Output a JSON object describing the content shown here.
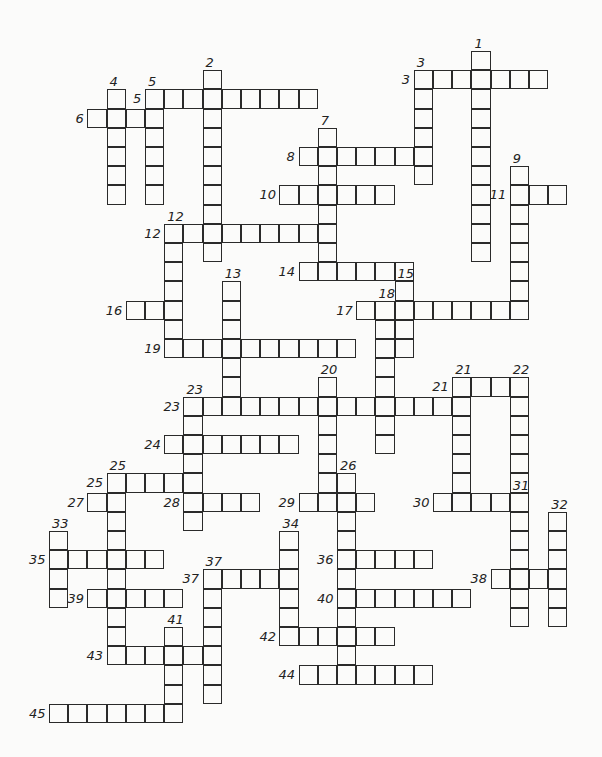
{
  "puzzle": {
    "type": "crossword",
    "grid_origin": {
      "x": 49,
      "y": 51,
      "cell": 19.2
    },
    "across": [
      {
        "number": "3",
        "col": 19,
        "row": 1,
        "length": 7
      },
      {
        "number": "5",
        "col": 5,
        "row": 2,
        "length": 9
      },
      {
        "number": "6",
        "col": 2,
        "row": 3,
        "length": 4
      },
      {
        "number": "8",
        "col": 13,
        "row": 5,
        "length": 7
      },
      {
        "number": "10",
        "col": 12,
        "row": 7,
        "length": 6
      },
      {
        "number": "11",
        "col": 24,
        "row": 7,
        "length": 3
      },
      {
        "number": "12",
        "col": 6,
        "row": 9,
        "length": 9
      },
      {
        "number": "14",
        "col": 13,
        "row": 11,
        "length": 6
      },
      {
        "number": "16",
        "col": 4,
        "row": 13,
        "length": 3
      },
      {
        "number": "17",
        "col": 16,
        "row": 13,
        "length": 9
      },
      {
        "number": "19",
        "col": 6,
        "row": 15,
        "length": 10
      },
      {
        "number": "21",
        "col": 21,
        "row": 17,
        "length": 4
      },
      {
        "number": "23",
        "col": 7,
        "row": 18,
        "length": 15
      },
      {
        "number": "24",
        "col": 6,
        "row": 20,
        "length": 7
      },
      {
        "number": "25",
        "col": 3,
        "row": 22,
        "length": 5
      },
      {
        "number": "27",
        "col": 2,
        "row": 23,
        "length": 2
      },
      {
        "number": "28",
        "col": 7,
        "row": 23,
        "length": 4
      },
      {
        "number": "29",
        "col": 13,
        "row": 23,
        "length": 4
      },
      {
        "number": "30",
        "col": 20,
        "row": 23,
        "length": 5
      },
      {
        "number": "35",
        "col": 0,
        "row": 26,
        "length": 6
      },
      {
        "number": "36",
        "col": 15,
        "row": 26,
        "length": 5
      },
      {
        "number": "37",
        "col": 8,
        "row": 27,
        "length": 5
      },
      {
        "number": "38",
        "col": 23,
        "row": 27,
        "length": 4
      },
      {
        "number": "39",
        "col": 2,
        "row": 28,
        "length": 5
      },
      {
        "number": "40",
        "col": 15,
        "row": 28,
        "length": 7
      },
      {
        "number": "42",
        "col": 12,
        "row": 30,
        "length": 6
      },
      {
        "number": "43",
        "col": 3,
        "row": 31,
        "length": 6
      },
      {
        "number": "44",
        "col": 13,
        "row": 32,
        "length": 7
      },
      {
        "number": "45",
        "col": 0,
        "row": 34,
        "length": 7
      }
    ],
    "down": [
      {
        "number": "1",
        "col": 22,
        "row": 0,
        "length": 11
      },
      {
        "number": "2",
        "col": 8,
        "row": 1,
        "length": 10
      },
      {
        "number": "3",
        "col": 19,
        "row": 1,
        "length": 6
      },
      {
        "number": "4",
        "col": 3,
        "row": 2,
        "length": 6
      },
      {
        "number": "5",
        "col": 5,
        "row": 2,
        "length": 6
      },
      {
        "number": "7",
        "col": 14,
        "row": 4,
        "length": 8
      },
      {
        "number": "9",
        "col": 24,
        "row": 6,
        "length": 8
      },
      {
        "number": "12",
        "col": 6,
        "row": 9,
        "length": 7
      },
      {
        "number": "13",
        "col": 9,
        "row": 12,
        "length": 7
      },
      {
        "number": "15",
        "col": 18,
        "row": 12,
        "length": 4
      },
      {
        "number": "18",
        "col": 17,
        "row": 13,
        "length": 8
      },
      {
        "number": "20",
        "col": 14,
        "row": 17,
        "length": 7
      },
      {
        "number": "21",
        "col": 21,
        "row": 17,
        "length": 7
      },
      {
        "number": "22",
        "col": 24,
        "row": 17,
        "length": 6
      },
      {
        "number": "23",
        "col": 7,
        "row": 18,
        "length": 7
      },
      {
        "number": "25",
        "col": 3,
        "row": 22,
        "length": 10
      },
      {
        "number": "26",
        "col": 15,
        "row": 22,
        "length": 11
      },
      {
        "number": "31",
        "col": 24,
        "row": 23,
        "length": 7
      },
      {
        "number": "32",
        "col": 26,
        "row": 24,
        "length": 6
      },
      {
        "number": "33",
        "col": 0,
        "row": 25,
        "length": 4
      },
      {
        "number": "34",
        "col": 12,
        "row": 25,
        "length": 5
      },
      {
        "number": "37",
        "col": 8,
        "row": 27,
        "length": 7
      },
      {
        "number": "41",
        "col": 6,
        "row": 30,
        "length": 5
      }
    ]
  }
}
